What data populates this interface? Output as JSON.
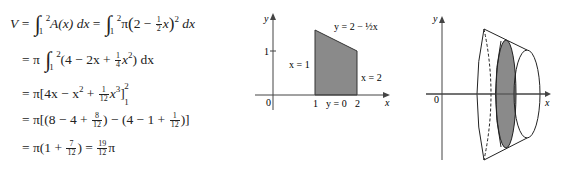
{
  "derivation": {
    "line1": {
      "lhs": "V",
      "eq": "=",
      "int1_lower": "1",
      "int1_upper": "2",
      "integrand1": "A(x) dx",
      "eq2": "=",
      "int2_lower": "1",
      "int2_upper": "2",
      "coef": "π",
      "inner": "2 − ",
      "frac_num": "1",
      "frac_den": "2",
      "var": "x",
      "power": "2",
      "dx": "dx"
    },
    "line2": {
      "eq": "= π",
      "int_lower": "1",
      "int_upper": "2",
      "poly_a": "(4 − 2x + ",
      "frac_num": "1",
      "frac_den": "4",
      "poly_b": "x",
      "power": "2",
      "close": ") dx"
    },
    "line3": {
      "eq": "= π",
      "body_a": "[4x − x",
      "pow1": "2",
      "body_b": " + ",
      "frac_num": "1",
      "frac_den": "12",
      "body_c": "x",
      "pow2": "3",
      "close": "]",
      "upper": "2",
      "lower": "1"
    },
    "line4": {
      "eq": "= π",
      "body_a": "[(8 − 4 + ",
      "f1_num": "8",
      "f1_den": "12",
      "body_b": ") − (4 − 1 + ",
      "f2_num": "1",
      "f2_den": "12",
      "close": ")]"
    },
    "line5": {
      "eq": "= π",
      "body_a": "(1 + ",
      "f1_num": "7",
      "f1_den": "12",
      "body_b": ") = ",
      "f2_num": "19",
      "f2_den": "12",
      "tail": "π"
    }
  },
  "region_graph": {
    "y_axis_label": "y",
    "x_axis_label": "x",
    "origin_label": "0",
    "y_tick_label": "1",
    "x_tick_labels": [
      "1",
      "2"
    ],
    "curve_label": "y = 2 − ½x",
    "left_bound_label": "x = 1",
    "right_bound_label": "x = 2",
    "bottom_bound_label": "y = 0",
    "fill_color": "#8a8a8a"
  },
  "solid_figure": {
    "y_axis_label": "y",
    "x_axis_label": "x",
    "origin_label": "0",
    "disk_fill_color": "#8a8a8a"
  }
}
